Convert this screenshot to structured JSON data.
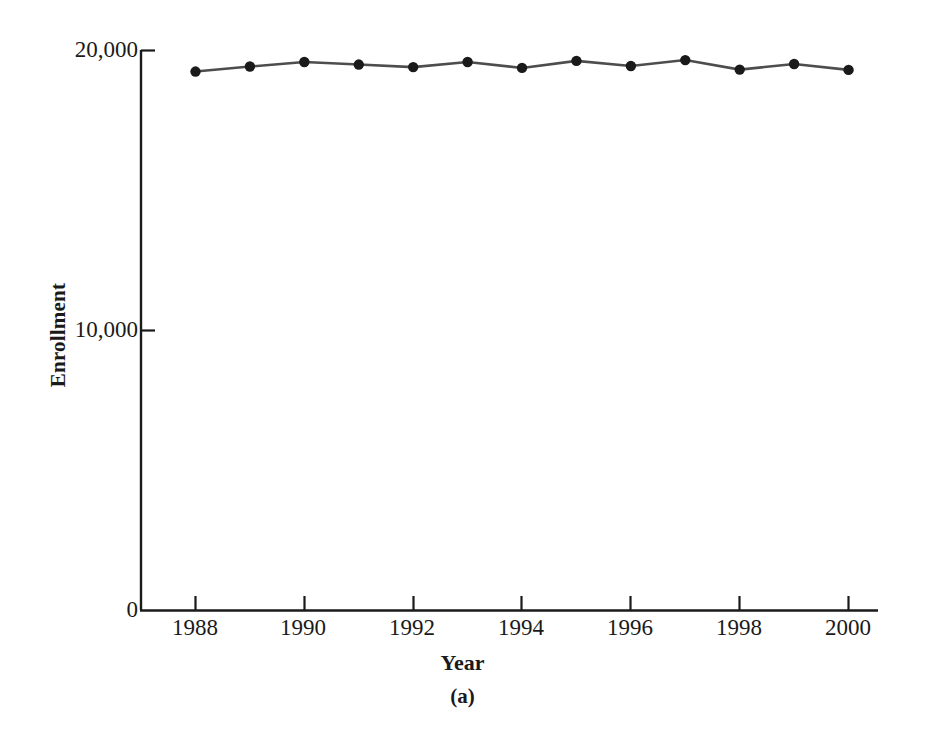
{
  "chart_data": {
    "type": "line",
    "title": "",
    "subcaption": "(a)",
    "xlabel": "Year",
    "ylabel": "Enrollment",
    "x": [
      1988,
      1989,
      1990,
      1991,
      1992,
      1993,
      1994,
      1995,
      1996,
      1997,
      1998,
      1999,
      2000
    ],
    "values": [
      19230,
      19410,
      19570,
      19480,
      19390,
      19570,
      19360,
      19610,
      19430,
      19640,
      19300,
      19500,
      19290
    ],
    "series": [
      {
        "name": "Enrollment",
        "values": [
          19230,
          19410,
          19570,
          19480,
          19390,
          19570,
          19360,
          19610,
          19430,
          19640,
          19300,
          19500,
          19290
        ]
      }
    ],
    "xlim": [
      1987.0,
      1987.0
    ],
    "ylim": [
      0,
      20000
    ],
    "x_tick_labels": [
      "1988",
      "1990",
      "1992",
      "1994",
      "1996",
      "1998",
      "2000"
    ],
    "x_tick_values": [
      1988,
      1990,
      1992,
      1994,
      1996,
      1998,
      2000
    ],
    "y_tick_labels": [
      "0",
      "10,000",
      "20,000"
    ],
    "y_tick_values": [
      0,
      10000,
      20000
    ],
    "grid": false,
    "legend": "none",
    "marker": "filled-circle",
    "line_color": "#4d4d4d",
    "marker_color": "#1a1a1a",
    "axis_color": "#1a1a1a",
    "background_color": "#ffffff"
  }
}
